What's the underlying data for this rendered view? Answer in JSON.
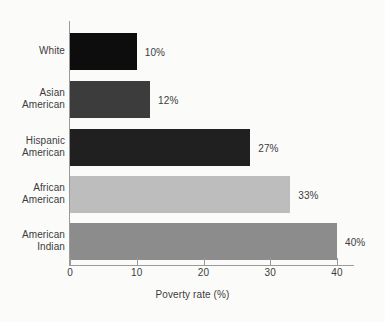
{
  "chart_data": {
    "type": "bar",
    "orientation": "horizontal",
    "title": "",
    "xlabel": "Poverty rate (%)",
    "ylabel": "",
    "xlim": [
      0,
      40
    ],
    "xticks": [
      0,
      10,
      20,
      30,
      40
    ],
    "xticklabels": [
      "0",
      "10",
      "20",
      "30",
      "40"
    ],
    "grid": false,
    "legend": false,
    "categories": [
      "White",
      "Asian American",
      "Hispanic American",
      "African American",
      "American Indian"
    ],
    "category_lines": [
      [
        "White"
      ],
      [
        "Asian",
        "American"
      ],
      [
        "Hispanic",
        "American"
      ],
      [
        "African",
        "American"
      ],
      [
        "American",
        "Indian"
      ]
    ],
    "values": [
      10,
      12,
      27,
      33,
      40
    ],
    "value_labels": [
      "10%",
      "12%",
      "27%",
      "33%",
      "40%"
    ],
    "bar_colors": [
      "#0d0d0d",
      "#3c3c3c",
      "#202020",
      "#bdbdbd",
      "#8c8c8c"
    ]
  },
  "style": {
    "background": "#fbfbfa",
    "axis_color": "#9a9a9a",
    "text_color": "#3c3c3c"
  }
}
